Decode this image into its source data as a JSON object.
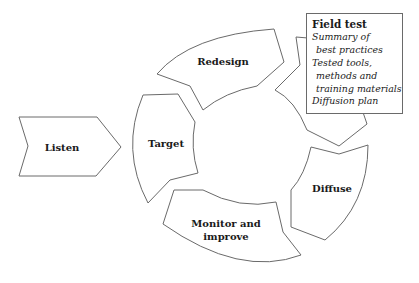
{
  "diagram": {
    "stages": [
      {
        "id": "listen",
        "label": "Listen"
      },
      {
        "id": "target",
        "label": "Target"
      },
      {
        "id": "redesign",
        "label": "Redesign"
      },
      {
        "id": "field-test",
        "label": "Field test"
      },
      {
        "id": "diffuse",
        "label": "Diffuse"
      },
      {
        "id": "monitor",
        "label_line1": "Monitor and",
        "label_line2": "improve"
      }
    ],
    "callout": {
      "title": "Field test",
      "lines": [
        "Summary of",
        "best practices",
        "Tested tools,",
        "methods and",
        "training materials",
        "Diffusion plan"
      ]
    },
    "colors": {
      "stroke": "#6a6a6a",
      "fill": "#ffffff",
      "text": "#1a1a1a"
    }
  }
}
